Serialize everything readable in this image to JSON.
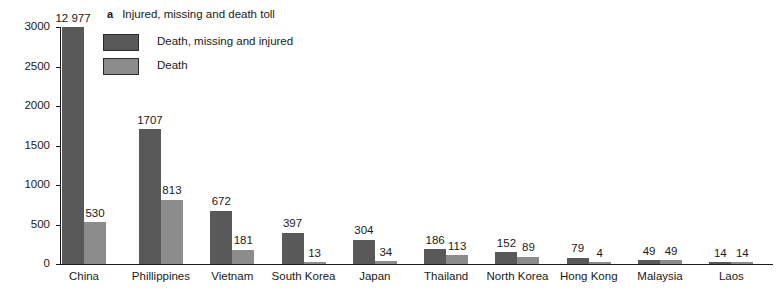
{
  "panel": {
    "letter": "a",
    "title": "Injured, missing and death toll"
  },
  "legend": {
    "items": [
      {
        "label": "Death, missing and injured",
        "color": "#595959",
        "key": "legend-swatch-death-missing-injured"
      },
      {
        "label": "Death",
        "color": "#8c8c8c",
        "key": "legend-swatch-death"
      }
    ]
  },
  "axis": {
    "y_ticks": [
      "0",
      "500",
      "1000",
      "1500",
      "2000",
      "2500",
      "3000"
    ]
  },
  "chart_data": {
    "type": "bar",
    "title": "Injured, missing and death toll",
    "xlabel": "",
    "ylabel": "",
    "ylim": [
      0,
      3000
    ],
    "ytick_interval": 500,
    "grid": false,
    "legend_position": "top-left",
    "note": "China 'Death, missing and injured' bar (12 977) exceeds the 3000 axis maximum and is drawn clipped at the top of the axis.",
    "categories": [
      "China",
      "Phillippines",
      "Vietnam",
      "South Korea",
      "Japan",
      "Thailand",
      "North Korea",
      "Hong Kong",
      "Malaysia",
      "Laos"
    ],
    "series": [
      {
        "name": "Death, missing and injured",
        "color": "#595959",
        "values": [
          12977,
          1707,
          672,
          397,
          304,
          186,
          152,
          79,
          49,
          14
        ],
        "labels": [
          "12 977",
          "1707",
          "672",
          "397",
          "304",
          "186",
          "152",
          "79",
          "49",
          "14"
        ]
      },
      {
        "name": "Death",
        "color": "#8c8c8c",
        "values": [
          530,
          813,
          181,
          13,
          34,
          113,
          89,
          4,
          49,
          14
        ],
        "labels": [
          "530",
          "813",
          "181",
          "13",
          "34",
          "113",
          "89",
          "4",
          "49",
          "14"
        ]
      }
    ]
  }
}
